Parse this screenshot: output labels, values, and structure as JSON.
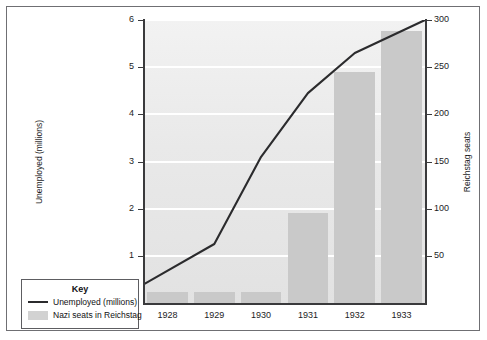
{
  "chart_data": {
    "type": "bar",
    "title": "",
    "subtitle": "",
    "categories": [
      "1928",
      "1929",
      "1930",
      "1931",
      "1932",
      "1933"
    ],
    "xlabel": "",
    "grid": true,
    "legend_position": "bottom-left",
    "axes": {
      "left": {
        "label": "Unemployed (millions)",
        "ticks": [
          "1",
          "2",
          "3",
          "4",
          "5",
          "6"
        ],
        "tick_values": [
          1,
          2,
          3,
          4,
          5,
          6
        ],
        "min": 0,
        "max": 6
      },
      "right": {
        "label": "Reichstag seats",
        "ticks": [
          "50",
          "100",
          "150",
          "200",
          "250",
          "300"
        ],
        "tick_values": [
          50,
          100,
          150,
          200,
          250,
          300
        ],
        "min": 0,
        "max": 300
      }
    },
    "series": [
      {
        "name": "Nazi seats in Reichstag",
        "type": "bar",
        "axis": "right",
        "unit": "seats",
        "color": "#c9c9c9",
        "values": [
          12,
          12,
          107,
          107,
          230,
          288
        ],
        "values_plotted": [
          12,
          12,
          12,
          95,
          245,
          288
        ]
      },
      {
        "name": "Unemployed (millions)",
        "type": "line",
        "axis": "left",
        "unit": "millions",
        "color": "#2b2b2d",
        "values": [
          0.4,
          1.25,
          3.1,
          4.45,
          5.3,
          6.0
        ]
      }
    ]
  },
  "legend": {
    "title": "Key",
    "entries": [
      {
        "label": "Unemployed (millions)",
        "marker": "line",
        "color": "#2b2b2d"
      },
      {
        "label": "Nazi seats in Reichstag",
        "marker": "swatch",
        "color": "#d2d2d2"
      }
    ]
  },
  "colors": {
    "bar": "#c9c9c9",
    "line": "#2b2b2d",
    "plot_background": "#ebebeb",
    "gridline": "#ffffff",
    "axis": "#3a3a3c",
    "frame": "#6f6f73",
    "text": "#1c1c1e"
  }
}
